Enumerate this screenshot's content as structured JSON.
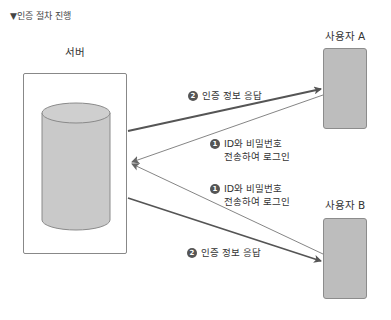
{
  "title": "▼인증 절차 진행",
  "server": {
    "label": "서버",
    "icon": "database-cylinder"
  },
  "users": [
    {
      "label": "사용자 A"
    },
    {
      "label": "사용자 B"
    }
  ],
  "steps": {
    "login_a": {
      "badge": "1",
      "line1": "ID와 비밀번호",
      "line2": "전송하여 로그인"
    },
    "response_a": {
      "badge": "2",
      "text": "인증 정보 응답"
    },
    "login_b": {
      "badge": "1",
      "line1": "ID와 비밀번호",
      "line2": "전송하여 로그인"
    },
    "response_b": {
      "badge": "2",
      "text": "인증 정보 응답"
    }
  },
  "colors": {
    "cylinder_fill": "#c9c9c9",
    "user_box_fill": "#bdbdbd",
    "line_thick": "#555555",
    "line_thin": "#666666"
  }
}
